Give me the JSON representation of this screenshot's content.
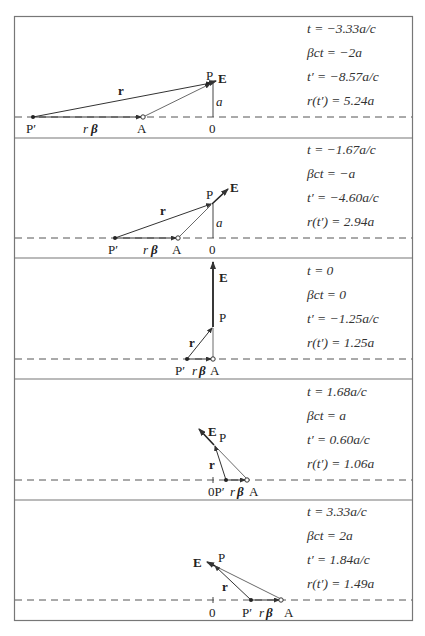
{
  "figure": {
    "frame_color": "#777777",
    "line_color": "#333333",
    "panels": [
      {
        "equations": {
          "t": "t = −3.33a/c",
          "bct": "βct = −2a",
          "tp": "t′ = −8.57a/c",
          "r": "r(t′) = 5.24a"
        },
        "labels": {
          "Pp": "P′",
          "rb_r": "r",
          "rb_b": "β",
          "A": "A",
          "O": "0",
          "P": "P",
          "E": "E",
          "r": "r",
          "a": "a"
        }
      },
      {
        "equations": {
          "t": "t = −1.67a/c",
          "bct": "βct = −a",
          "tp": "t′ = −4.60a/c",
          "r": "r(t′) = 2.94a"
        },
        "labels": {
          "Pp": "P′",
          "rb_r": "r",
          "rb_b": "β",
          "A": "A",
          "O": "0",
          "P": "P",
          "E": "E",
          "r": "r",
          "a": "a"
        }
      },
      {
        "equations": {
          "t": "t = 0",
          "bct": "βct = 0",
          "tp": "t′ = −1.25a/c",
          "r": "r(t′) = 1.25a"
        },
        "labels": {
          "Pp": "P′",
          "rb_r": "r",
          "rb_b": "β",
          "A": "A",
          "P": "P",
          "E": "E",
          "r": "r"
        }
      },
      {
        "equations": {
          "t": "t = 1.68a/c",
          "bct": "βct = a",
          "tp": "t′ = 0.60a/c",
          "r": "r(t′) = 1.06a"
        },
        "labels": {
          "Pp": "0P′",
          "rb_r": "r",
          "rb_b": "β",
          "A": "A",
          "P": "P",
          "E": "E",
          "r": "r"
        }
      },
      {
        "equations": {
          "t": "t = 3.33a/c",
          "bct": "βct = 2a",
          "tp": "t′ = 1.84a/c",
          "r": "r(t′) = 1.49a"
        },
        "labels": {
          "Pp": "P′",
          "rb_r": "r",
          "rb_b": "β",
          "A": "A",
          "O": "0",
          "P": "P",
          "E": "E",
          "r": "r"
        }
      }
    ]
  }
}
